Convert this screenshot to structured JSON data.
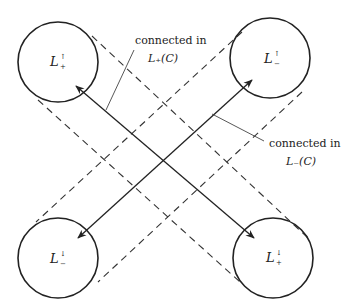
{
  "diagram": {
    "nodes": [
      {
        "id": "tl",
        "base": "L",
        "sup": "↑",
        "sub": "+",
        "cx": 58,
        "cy": 62,
        "r": 40
      },
      {
        "id": "tr",
        "base": "L",
        "sup": "↑",
        "sub": "−",
        "cx": 270,
        "cy": 58,
        "r": 40
      },
      {
        "id": "bl",
        "base": "L",
        "sup": "↓",
        "sub": "−",
        "cx": 58,
        "cy": 258,
        "r": 40
      },
      {
        "id": "br",
        "base": "L",
        "sup": "↓",
        "sub": "+",
        "cx": 273,
        "cy": 258,
        "r": 40
      }
    ],
    "annotations": [
      {
        "id": "plus",
        "line1": "connected in",
        "line2": "L₊(C)"
      },
      {
        "id": "minus",
        "line1": "connected in",
        "line2": "L₋(C)"
      }
    ],
    "edges": [
      {
        "from": "tl",
        "to": "br",
        "style": "solid",
        "arrows": "both"
      },
      {
        "from": "tr",
        "to": "bl",
        "style": "solid",
        "arrows": "both"
      },
      {
        "from": "tl",
        "to": "br",
        "style": "dashed-band"
      },
      {
        "from": "tr",
        "to": "bl",
        "style": "dashed-band"
      }
    ],
    "colors": {
      "stroke": "#222222",
      "background": "#ffffff"
    }
  }
}
